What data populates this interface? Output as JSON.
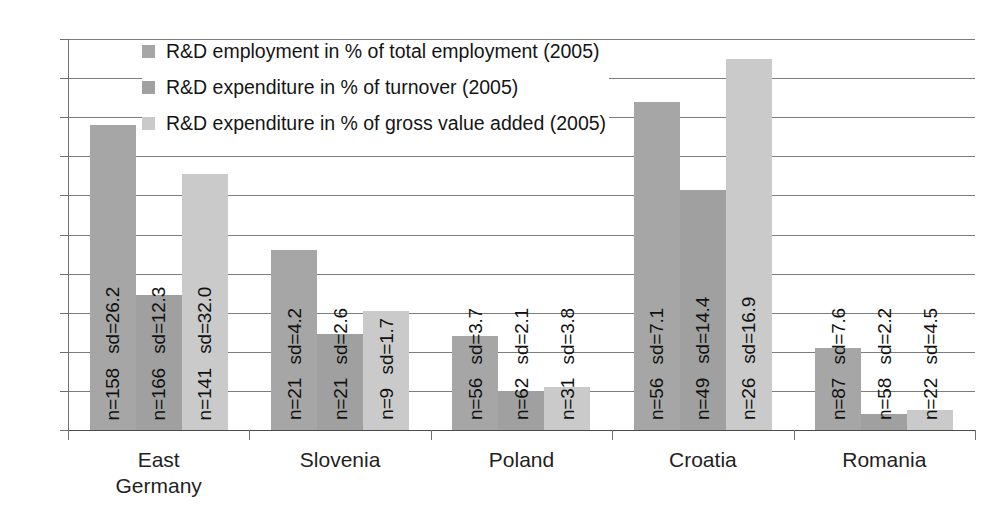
{
  "chart_data": {
    "type": "bar",
    "title": "",
    "xlabel": "",
    "ylabel": "",
    "ylim": [
      0,
      10
    ],
    "yticks": [
      0,
      1,
      2,
      3,
      4,
      5,
      6,
      7,
      8,
      9,
      10
    ],
    "grid": true,
    "legend_position": "inside-top-left",
    "categories": [
      "East Germany",
      "Slovenia",
      "Poland",
      "Croatia",
      "Romania"
    ],
    "series": [
      {
        "name": "R&D employment in % of total employment (2005)",
        "color": "#a6a6a6",
        "values": [
          7.8,
          4.6,
          2.4,
          8.4,
          2.1
        ],
        "n": [
          "n=158",
          "n=21",
          "n=56",
          "n=56",
          "n=87"
        ],
        "sd": [
          "sd=26.2",
          "sd=4.2",
          "sd=3.7",
          "sd=7.1",
          "sd=7.6"
        ]
      },
      {
        "name": "R&D expenditure in % of turnover (2005)",
        "color": "#a0a0a0",
        "values": [
          3.45,
          2.45,
          1.0,
          6.15,
          0.4
        ],
        "n": [
          "n=166",
          "n=21",
          "n=62",
          "n=49",
          "n=58"
        ],
        "sd": [
          "sd=12.3",
          "sd=2.6",
          "sd=2.1",
          "sd=14.4",
          "sd=2.2"
        ]
      },
      {
        "name": "R&D expenditure in % of gross value added (2005)",
        "color": "#cacaca",
        "values": [
          6.55,
          3.05,
          1.1,
          9.5,
          0.5
        ],
        "n": [
          "n=141",
          "n=9",
          "n=31",
          "n=26",
          "n=22"
        ],
        "sd": [
          "sd=32.0",
          "sd=1.7",
          "sd=3.8",
          "sd=16.9",
          "sd=4.5"
        ]
      }
    ]
  },
  "axis": {
    "y_tick_labels": [
      "0",
      "1",
      "2",
      "3",
      "4",
      "5",
      "6",
      "7",
      "8",
      "9",
      "10"
    ]
  },
  "legend": {
    "items": [
      {
        "label": "R&D employment in % of total employment (2005)",
        "color": "#a6a6a6"
      },
      {
        "label": "R&D expenditure in % of turnover (2005)",
        "color": "#a0a0a0"
      },
      {
        "label": "R&D expenditure in % of gross value added (2005)",
        "color": "#cacaca"
      }
    ]
  }
}
